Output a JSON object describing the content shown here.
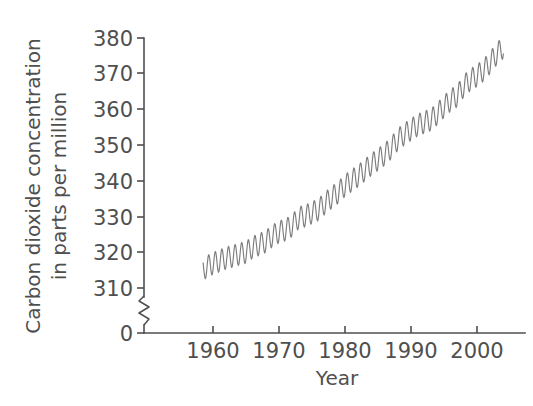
{
  "chart_data": {
    "type": "line",
    "title": "",
    "xlabel": "Year",
    "ylabel": "Carbon dioxide concentration in parts per million",
    "ylabel_lines": [
      "Carbon dioxide concentration",
      "in parts per million"
    ],
    "xtick_labels": [
      "1960",
      "1970",
      "1980",
      "1990",
      "2000"
    ],
    "xticks": [
      1960,
      1970,
      1980,
      1990,
      2000
    ],
    "ytick_labels": [
      "0",
      "310",
      "320",
      "330",
      "340",
      "350",
      "360",
      "370",
      "380"
    ],
    "yticks": [
      0,
      310,
      320,
      330,
      340,
      350,
      360,
      370,
      380
    ],
    "xlim": [
      1955.0,
      2004.5
    ],
    "ylim": [
      310,
      380
    ],
    "y_axis_break": {
      "present": true,
      "between": [
        0,
        310
      ],
      "style": "zigzag"
    },
    "grid": false,
    "legend": null,
    "line_color": "#7d7d7d",
    "text_color": "#4f4f4f",
    "series": [
      {
        "name": "Atmospheric CO2 (Mauna Loa)",
        "description": "Monthly mean CO2 concentration with annual seasonal cycle superimposed on rising trend",
        "seasonal_amplitude_ppm": 3.1,
        "x": [
          1958.5,
          1959.0,
          1960.0,
          1961.0,
          1962.0,
          1963.0,
          1964.0,
          1965.0,
          1966.0,
          1967.0,
          1968.0,
          1969.0,
          1970.0,
          1971.0,
          1972.0,
          1973.0,
          1974.0,
          1975.0,
          1976.0,
          1977.0,
          1978.0,
          1979.0,
          1980.0,
          1981.0,
          1982.0,
          1983.0,
          1984.0,
          1985.0,
          1986.0,
          1987.0,
          1988.0,
          1989.0,
          1990.0,
          1991.0,
          1992.0,
          1993.0,
          1994.0,
          1995.0,
          1996.0,
          1997.0,
          1998.0,
          1999.0,
          2000.0,
          2001.0,
          2002.0,
          2003.0,
          2004.0
        ],
        "annual_mean_values": [
          315.2,
          315.9,
          316.9,
          317.6,
          318.4,
          318.9,
          319.5,
          320.0,
          321.4,
          322.2,
          323.0,
          324.6,
          325.7,
          326.3,
          327.5,
          329.7,
          330.2,
          331.1,
          332.0,
          333.8,
          335.4,
          336.8,
          338.7,
          340.1,
          341.4,
          343.0,
          344.6,
          346.0,
          347.4,
          349.2,
          351.6,
          353.1,
          354.4,
          355.6,
          356.4,
          357.1,
          358.8,
          360.8,
          362.6,
          363.8,
          366.6,
          368.3,
          369.5,
          371.0,
          373.1,
          375.6,
          377.4
        ],
        "note": "Plotted curve is monthly resolution; visible sawtooth is the annual seasonal cycle."
      }
    ],
    "source_caption": ""
  },
  "figure": {
    "background": "#ffffff",
    "axes": {
      "y_axis_name": "y-axis",
      "x_axis_name": "x-axis"
    }
  }
}
